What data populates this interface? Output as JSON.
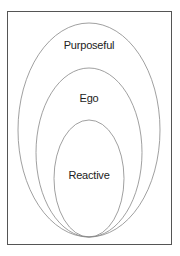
{
  "diagram": {
    "type": "nested-ellipses",
    "layers": [
      {
        "label": "Purposeful",
        "level": "outer"
      },
      {
        "label": "Ego",
        "level": "middle"
      },
      {
        "label": "Reactive",
        "level": "inner"
      }
    ],
    "colors": {
      "stroke": "#888888",
      "frame": "#555555",
      "text": "#222222",
      "background": "#ffffff"
    }
  }
}
